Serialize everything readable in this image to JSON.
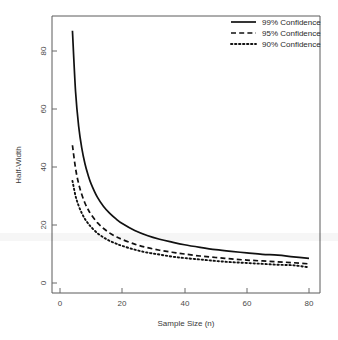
{
  "chart_data": {
    "type": "line",
    "title": "",
    "xlabel": "Sample Size (n)",
    "ylabel": "Half-Width",
    "xlim": [
      0,
      84
    ],
    "ylim": [
      -2,
      92
    ],
    "xticks": [
      0,
      20,
      40,
      60,
      80
    ],
    "yticks": [
      0,
      20,
      40,
      60,
      80
    ],
    "xtick_labels": [
      "0",
      "20",
      "40",
      "60",
      "80"
    ],
    "ytick_labels": [
      "0",
      "20",
      "40",
      "60",
      "80"
    ],
    "grid": false,
    "legend_position": "top-right",
    "x": [
      4,
      5,
      6,
      7,
      8,
      9,
      10,
      12,
      14,
      16,
      18,
      20,
      24,
      28,
      32,
      36,
      40,
      45,
      50,
      55,
      60,
      65,
      70,
      75,
      80
    ],
    "series": [
      {
        "name": "99% Confidence",
        "style": "solid",
        "color": "#111111",
        "values": [
          87.0,
          66.0,
          54.0,
          46.5,
          41.2,
          37.3,
          34.2,
          29.6,
          26.4,
          24.0,
          22.1,
          20.5,
          18.1,
          16.4,
          15.1,
          14.1,
          13.2,
          12.3,
          11.5,
          10.9,
          10.4,
          9.9,
          9.6,
          9.0,
          8.5
        ],
        "legend_label": "99% Confidence"
      },
      {
        "name": "95% Confidence",
        "style": "dashed",
        "color": "#111111",
        "values": [
          47.5,
          39.5,
          34.2,
          30.5,
          27.6,
          25.4,
          23.6,
          20.8,
          18.8,
          17.2,
          16.0,
          15.0,
          13.4,
          12.2,
          11.3,
          10.6,
          10.0,
          9.3,
          8.8,
          8.3,
          7.9,
          7.6,
          7.3,
          7.0,
          6.6
        ],
        "legend_label": "95% Confidence"
      },
      {
        "name": "90% Confidence",
        "style": "dotted",
        "color": "#111111",
        "values": [
          35.2,
          30.0,
          26.6,
          24.1,
          22.1,
          20.6,
          19.3,
          17.2,
          15.7,
          14.5,
          13.6,
          12.8,
          11.5,
          10.5,
          9.8,
          9.1,
          8.6,
          8.1,
          7.6,
          7.2,
          6.9,
          6.6,
          6.3,
          6.1,
          5.4
        ],
        "legend_label": "90% Confidence"
      }
    ]
  },
  "axes": {
    "x_title": "Sample Size (n)",
    "y_title": "Half-Width"
  },
  "legend": {
    "items": [
      {
        "label": "99% Confidence",
        "style": "solid"
      },
      {
        "label": "95% Confidence",
        "style": "dashed"
      },
      {
        "label": "90% Confidence",
        "style": "dotted"
      }
    ]
  }
}
